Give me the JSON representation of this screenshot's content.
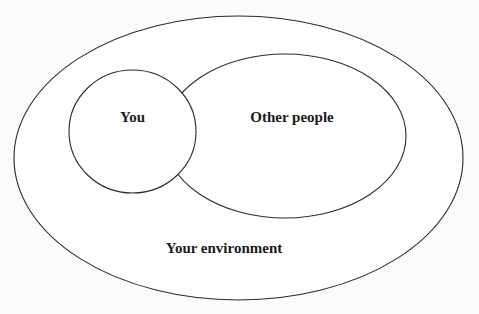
{
  "diagram": {
    "type": "nested-venn",
    "colors": {
      "background": "#fbfbfb",
      "stroke": "#2a2a2a",
      "fill": "#ffffff",
      "text": "#1a1a1a"
    },
    "regions": [
      {
        "id": "environment",
        "label": "Your environment",
        "shape": "ellipse",
        "cx": 238.5,
        "cy": 158,
        "rx": 224.5,
        "ry": 142
      },
      {
        "id": "other-people",
        "label": "Other people",
        "shape": "ellipse",
        "cx": 285,
        "cy": 136,
        "rx": 121,
        "ry": 82
      },
      {
        "id": "you",
        "label": "You",
        "shape": "ellipse",
        "cx": 132.5,
        "cy": 131.5,
        "rx": 63.5,
        "ry": 61.5
      }
    ]
  }
}
